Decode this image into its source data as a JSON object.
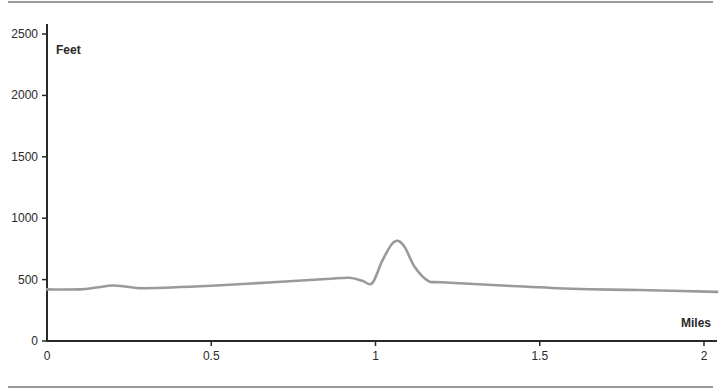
{
  "chart_data": {
    "type": "line",
    "title": "",
    "xlabel": "Miles",
    "ylabel": "Feet",
    "xlim": [
      0,
      2.04
    ],
    "ylim": [
      0,
      2500
    ],
    "grid": false,
    "legend": null,
    "xticks": [
      0,
      0.5,
      1,
      1.5,
      2
    ],
    "xtick_labels": [
      "0",
      "0.5",
      "1",
      "1.5",
      "2"
    ],
    "yticks": [
      0,
      500,
      1000,
      1500,
      2000,
      2500
    ],
    "ytick_labels": [
      "0",
      "500",
      "1000",
      "1500",
      "2000",
      "2500"
    ],
    "series": [
      {
        "name": "Elevation",
        "color": "#9a9a9a",
        "x": [
          0,
          0.1,
          0.15,
          0.2,
          0.25,
          0.3,
          0.5,
          0.7,
          0.85,
          0.92,
          0.96,
          0.99,
          1.02,
          1.05,
          1.07,
          1.09,
          1.12,
          1.16,
          1.2,
          1.4,
          1.6,
          1.8,
          2.04
        ],
        "values": [
          420,
          420,
          435,
          452,
          440,
          430,
          450,
          480,
          505,
          515,
          490,
          470,
          650,
          790,
          815,
          760,
          600,
          490,
          478,
          450,
          425,
          415,
          400
        ]
      }
    ]
  }
}
